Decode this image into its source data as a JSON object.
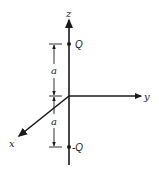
{
  "diagram": {
    "axes": {
      "z_label": "z",
      "y_label": "y",
      "x_label": "x"
    },
    "charges": {
      "top_label": "Q",
      "bottom_label": "-Q"
    },
    "dimensions": {
      "upper_label": "a",
      "lower_label": "a"
    },
    "colors": {
      "stroke": "#1a1a1a",
      "background": "#ffffff"
    }
  }
}
